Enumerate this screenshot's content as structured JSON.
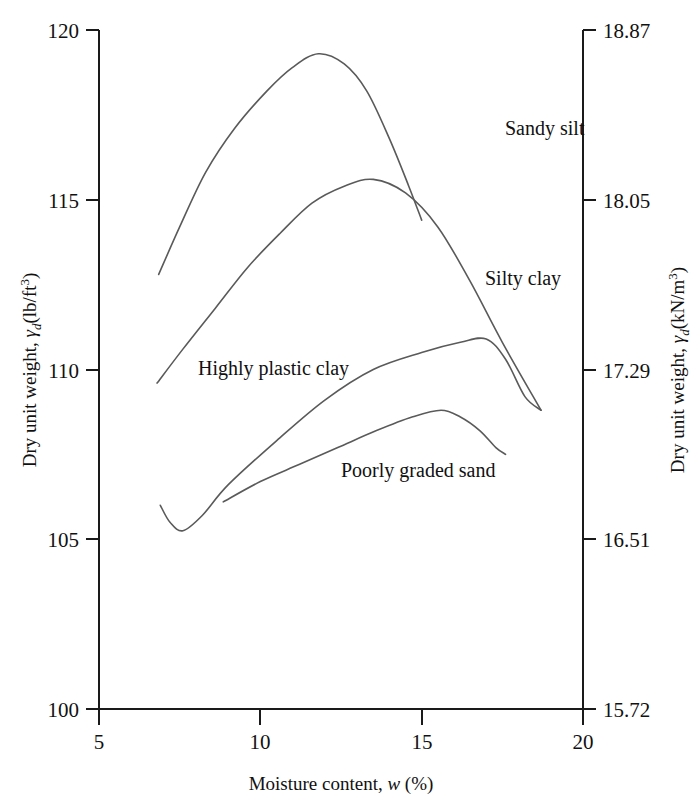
{
  "chart_data": {
    "type": "line",
    "title": "",
    "xlabel": "Moisture content, w (%)",
    "ylabel_left": "Dry unit weight, γd (lb/ft3)",
    "ylabel_right": "Dry unit weight, γd (kN/m3)",
    "xlim": [
      5,
      20
    ],
    "ylim_left": [
      100,
      120
    ],
    "ylim_right": [
      15.72,
      18.87
    ],
    "grid": false,
    "legend": "inline-curve-labels",
    "xticks": [
      "5",
      "10",
      "15",
      "20"
    ],
    "xtick_values": [
      5,
      10,
      15,
      20
    ],
    "yticks_left": [
      "100",
      "105",
      "110",
      "115",
      "120"
    ],
    "ytick_values_left": [
      100,
      105,
      110,
      115,
      120
    ],
    "yticks_right": [
      "15.72",
      "16.51",
      "17.29",
      "18.05",
      "18.87"
    ],
    "ytick_values_right": [
      15.72,
      16.51,
      17.29,
      18.05,
      18.87
    ],
    "series": [
      {
        "name": "Sandy silt",
        "label": "Sandy silt",
        "points": [
          [
            6.85,
            112.8
          ],
          [
            7.5,
            114.2
          ],
          [
            8.3,
            115.8
          ],
          [
            9.2,
            117.1
          ],
          [
            10.2,
            118.2
          ],
          [
            11.0,
            118.9
          ],
          [
            11.8,
            119.3
          ],
          [
            12.6,
            119.0
          ],
          [
            13.3,
            118.2
          ],
          [
            14.0,
            116.8
          ],
          [
            14.6,
            115.4
          ],
          [
            15.0,
            114.4
          ]
        ]
      },
      {
        "name": "Silty clay",
        "label": "Silty clay",
        "points": [
          [
            6.8,
            109.6
          ],
          [
            7.6,
            110.6
          ],
          [
            8.6,
            111.8
          ],
          [
            9.6,
            113.0
          ],
          [
            10.6,
            114.0
          ],
          [
            11.6,
            114.9
          ],
          [
            12.6,
            115.4
          ],
          [
            13.5,
            115.6
          ],
          [
            14.5,
            115.2
          ],
          [
            15.5,
            114.2
          ],
          [
            16.5,
            112.6
          ],
          [
            17.5,
            110.8
          ],
          [
            18.7,
            108.8
          ]
        ]
      },
      {
        "name": "Highly plastic clay",
        "label": "Highly plastic clay",
        "points": [
          [
            6.9,
            106.0
          ],
          [
            7.2,
            105.5
          ],
          [
            7.6,
            105.25
          ],
          [
            8.2,
            105.7
          ],
          [
            9.0,
            106.6
          ],
          [
            10.5,
            107.9
          ],
          [
            12.0,
            109.1
          ],
          [
            13.5,
            110.0
          ],
          [
            15.0,
            110.5
          ],
          [
            16.2,
            110.8
          ],
          [
            17.0,
            110.9
          ],
          [
            17.6,
            110.3
          ],
          [
            18.2,
            109.2
          ],
          [
            18.7,
            108.8
          ]
        ]
      },
      {
        "name": "Poorly graded sand",
        "label": "Poorly graded sand",
        "points": [
          [
            8.85,
            106.1
          ],
          [
            10.0,
            106.7
          ],
          [
            11.2,
            107.2
          ],
          [
            12.4,
            107.7
          ],
          [
            13.6,
            108.2
          ],
          [
            14.7,
            108.6
          ],
          [
            15.6,
            108.8
          ],
          [
            16.2,
            108.6
          ],
          [
            16.8,
            108.2
          ],
          [
            17.3,
            107.7
          ],
          [
            17.6,
            107.5
          ]
        ]
      }
    ],
    "annotations": [
      {
        "text": "Sandy silt",
        "x_px": 505,
        "y_px": 135
      },
      {
        "text": "Silty clay",
        "x_px": 485,
        "y_px": 285
      },
      {
        "text": "Highly plastic clay",
        "x_px": 198,
        "y_px": 375
      },
      {
        "text": "Poorly graded sand",
        "x_px": 341,
        "y_px": 477
      }
    ]
  },
  "axes": {
    "left_title_parts": {
      "main": "Dry unit weight, ",
      "gamma": "γ",
      "sub": "d",
      "units": "(lb/ft",
      "exp": "3",
      "close": ")"
    },
    "right_title_parts": {
      "main": "Dry unit weight, ",
      "gamma": "γ",
      "sub": "d",
      "units": "(kN/m",
      "exp": "3",
      "close": ")"
    },
    "x_title_parts": {
      "main": "Moisture content, ",
      "var": "w",
      "units": " (%)"
    }
  }
}
